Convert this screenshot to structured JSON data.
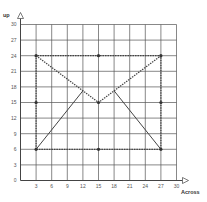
{
  "chart_data": {
    "type": "line",
    "title": "",
    "xlabel": "Across",
    "ylabel": "up",
    "xlim": [
      0,
      30
    ],
    "ylim": [
      0,
      30
    ],
    "grid": true,
    "grid_step": 3,
    "x_ticks": [
      3,
      6,
      9,
      12,
      15,
      18,
      21,
      24,
      27,
      30
    ],
    "y_ticks": [
      0,
      3,
      6,
      9,
      12,
      15,
      18,
      21,
      24,
      27,
      30
    ],
    "series": [
      {
        "name": "rectangle",
        "style": "dashed",
        "points": [
          [
            3,
            6
          ],
          [
            3,
            24
          ],
          [
            27,
            24
          ],
          [
            27,
            6
          ],
          [
            3,
            6
          ]
        ]
      },
      {
        "name": "envelope-flap",
        "style": "dashed",
        "points": [
          [
            3,
            24
          ],
          [
            15,
            15
          ],
          [
            27,
            24
          ]
        ]
      },
      {
        "name": "left-solid",
        "style": "solid",
        "points": [
          [
            3,
            6
          ],
          [
            12,
            17.25
          ]
        ]
      },
      {
        "name": "right-solid",
        "style": "solid",
        "points": [
          [
            18,
            17.25
          ],
          [
            27,
            6
          ]
        ]
      }
    ],
    "markers": [
      [
        3,
        6
      ],
      [
        3,
        15
      ],
      [
        3,
        24
      ],
      [
        15,
        24
      ],
      [
        27,
        24
      ],
      [
        27,
        15
      ],
      [
        27,
        6
      ],
      [
        15,
        6
      ],
      [
        15,
        15
      ]
    ]
  },
  "colors": {
    "grid": "#555555",
    "line": "#444444",
    "axis": "#444444"
  }
}
